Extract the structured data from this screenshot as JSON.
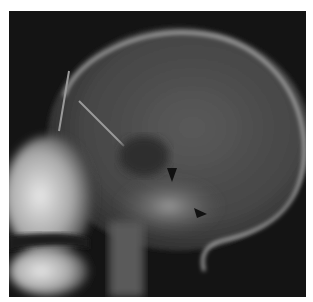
{
  "image": {
    "description": "Lateral skull radiograph",
    "background": "#141414",
    "frame": {
      "x": 9,
      "y": 11,
      "width": 297,
      "height": 286
    },
    "annotations": [
      {
        "type": "arrowhead",
        "x": 172,
        "y": 173,
        "direction": "down",
        "color": "#111111"
      },
      {
        "type": "arrowhead",
        "x": 201,
        "y": 212,
        "direction": "down-left",
        "color": "#111111"
      }
    ]
  }
}
